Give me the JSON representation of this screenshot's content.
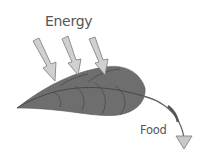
{
  "diagram": {
    "labels": {
      "energy": "Energy",
      "food": "Food"
    },
    "nodes": [
      {
        "id": "energy",
        "label": "Energy",
        "type": "input"
      },
      {
        "id": "leaf",
        "label": "",
        "type": "process"
      },
      {
        "id": "food",
        "label": "Food",
        "type": "output"
      }
    ],
    "edges": [
      {
        "from": "energy",
        "to": "leaf",
        "count": 3
      },
      {
        "from": "leaf",
        "to": "food",
        "count": 1
      }
    ],
    "colors": {
      "leaf": "#6e6e6e",
      "leaf_vein": "#4a4a4a",
      "arrow_fill": "#c8c8c8",
      "arrow_stroke": "#7a7a7a",
      "text": "#555555"
    }
  }
}
